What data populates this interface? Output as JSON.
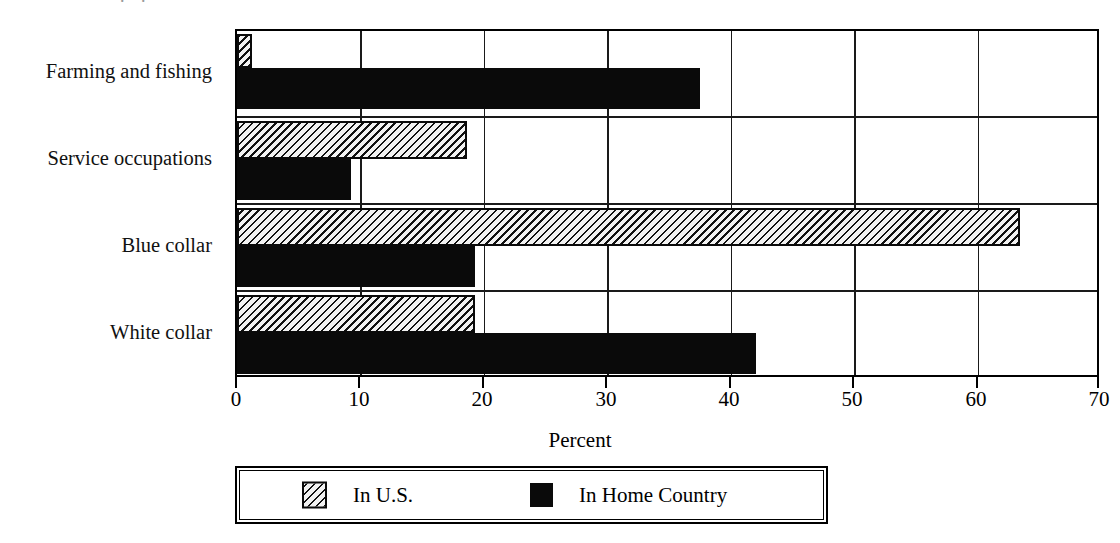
{
  "chart_data": {
    "type": "bar",
    "orientation": "horizontal",
    "title": "",
    "xlabel": "Percent",
    "ylabel": "",
    "xlim": [
      0,
      70
    ],
    "xticks": [
      0,
      10,
      20,
      30,
      40,
      50,
      60,
      70
    ],
    "xtick_labels": [
      "0",
      "10",
      "20",
      "30",
      "40",
      "50",
      "60",
      "70"
    ],
    "grid": "vertical",
    "legend_position": "bottom",
    "categories": [
      "Farming and fishing",
      "Service occupations",
      "Blue collar",
      "White collar"
    ],
    "series": [
      {
        "name": "In U.S.",
        "pattern": "hatched",
        "color": "#f2f2f2",
        "values": [
          1.2,
          18.6,
          63.4,
          19.3
        ]
      },
      {
        "name": "In Home Country",
        "pattern": "solid",
        "color": "#0a0a0a",
        "values": [
          37.7,
          9.3,
          19.4,
          42.3
        ]
      }
    ]
  },
  "axis": {
    "x_title": "Percent"
  },
  "legend": {
    "items": [
      {
        "label": "In U.S."
      },
      {
        "label": "In Home Country"
      }
    ]
  }
}
